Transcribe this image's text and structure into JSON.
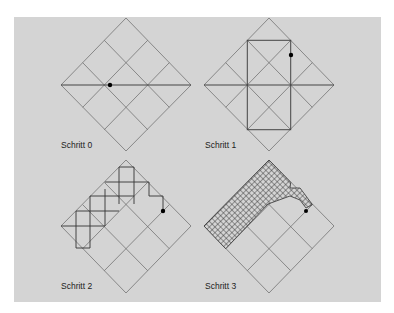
{
  "figure": {
    "background": "#d4d4d4",
    "line_color": "#555555",
    "panels": [
      {
        "id": "step0",
        "label": "Schritt 0",
        "cx": 126,
        "cy": 85,
        "dot": [
          110,
          85
        ]
      },
      {
        "id": "step1",
        "label": "Schritt 1",
        "cx": 269,
        "cy": 85,
        "dot": [
          291,
          55
        ]
      },
      {
        "id": "step2",
        "label": "Schritt 2",
        "cx": 126,
        "cy": 226,
        "dot": [
          163,
          211
        ]
      },
      {
        "id": "step3",
        "label": "Schritt 3",
        "cx": 269,
        "cy": 226,
        "dot": [
          306,
          211
        ]
      }
    ]
  }
}
